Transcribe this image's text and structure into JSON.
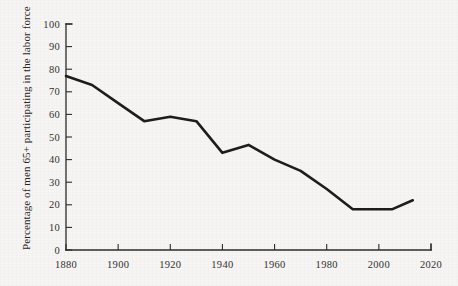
{
  "page": {
    "background_color": "#f6f5f3",
    "ink_color": "#1d1d1d",
    "cropped_top_text": ""
  },
  "chart_data": {
    "type": "line",
    "title": "",
    "subtitle": "",
    "xlabel": "",
    "ylabel": "Percentage of men 65+ participating in the labor force",
    "xlim": [
      1880,
      2020
    ],
    "ylim": [
      0,
      100
    ],
    "grid": false,
    "legend": false,
    "legend_position": "none",
    "x_ticks": [
      1880,
      1900,
      1920,
      1940,
      1960,
      1980,
      2000,
      2020
    ],
    "x_tick_labels": [
      "1880",
      "1900",
      "1920",
      "1940",
      "1960",
      "1980",
      "2000",
      "2020"
    ],
    "y_ticks": [
      0,
      10,
      20,
      30,
      40,
      50,
      60,
      70,
      80,
      90,
      100
    ],
    "y_tick_labels": [
      "0",
      "10",
      "20",
      "30",
      "40",
      "50",
      "60",
      "70",
      "80",
      "90",
      "100"
    ],
    "series": [
      {
        "name": "Men 65+ labor force participation",
        "color": "#1d1d1d",
        "x": [
          1880,
          1890,
          1900,
          1910,
          1920,
          1930,
          1940,
          1950,
          1960,
          1970,
          1980,
          1990,
          2000,
          2005,
          2013
        ],
        "values": [
          77,
          73,
          65,
          57,
          59,
          57,
          43,
          46.5,
          40,
          35,
          27,
          18,
          18,
          18,
          22
        ]
      }
    ],
    "annotations": []
  }
}
